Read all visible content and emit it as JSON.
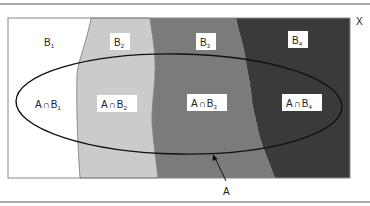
{
  "diagram": {
    "universe_label": "X",
    "set_label": "A",
    "partitions": [
      {
        "name": "B",
        "sub": "1",
        "color": "#ffffff"
      },
      {
        "name": "B",
        "sub": "2",
        "color": "#cbcbcb"
      },
      {
        "name": "B",
        "sub": "3",
        "color": "#7b7b7b"
      },
      {
        "name": "B",
        "sub": "4",
        "color": "#3a3a3a"
      }
    ],
    "intersections": [
      {
        "prefix": "A",
        "op": "∩",
        "name": "B",
        "sub": "1"
      },
      {
        "prefix": "A",
        "op": "∩",
        "name": "B",
        "sub": "2"
      },
      {
        "prefix": "A",
        "op": "∩",
        "name": "B",
        "sub": "3"
      },
      {
        "prefix": "A",
        "op": "∩",
        "name": "B",
        "sub": "4"
      }
    ]
  }
}
